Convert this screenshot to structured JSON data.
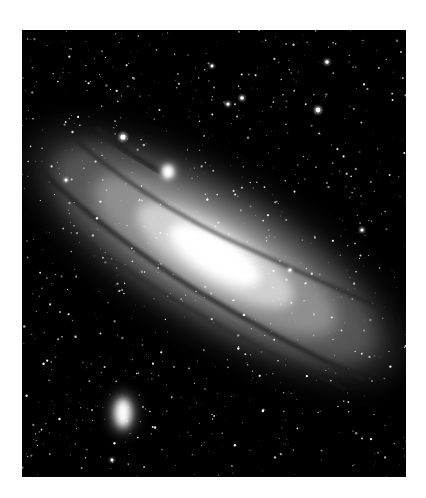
{
  "image": {
    "subject": "Andromeda Galaxy (spiral galaxy) with companion galaxies on a star field",
    "alt": "Black-and-white astronomical photograph of a large spiral galaxy seen at a steep angle, with two small companion galaxies and many foreground stars",
    "frame": {
      "x": 22,
      "y": 30,
      "width": 384,
      "height": 447
    },
    "colors": {
      "page_background": "#ffffff",
      "sky": "#000000",
      "core": "#ffffff",
      "disk_inner": "#d9d9d9",
      "disk_outer": "#8a8a8a",
      "halo": "#4a4a4a",
      "dust_lane": "#1a1a1a",
      "star": "#ffffff"
    },
    "galaxy": {
      "center": [
        193,
        225
      ],
      "rotation_deg": 31,
      "layers": [
        {
          "rx": 215,
          "ry": 78,
          "color": "#3a3a3a",
          "opacity": 0.55,
          "blur": 14
        },
        {
          "rx": 185,
          "ry": 62,
          "color": "#7a7a7a",
          "opacity": 0.6,
          "blur": 10
        },
        {
          "rx": 140,
          "ry": 44,
          "color": "#a8a8a8",
          "opacity": 0.7,
          "blur": 8
        },
        {
          "rx": 90,
          "ry": 30,
          "color": "#dcdcdc",
          "opacity": 0.85,
          "blur": 6
        },
        {
          "rx": 52,
          "ry": 20,
          "color": "#ffffff",
          "opacity": 1,
          "blur": 5
        },
        {
          "rx": 28,
          "ry": 12,
          "color": "#ffffff",
          "opacity": 1,
          "blur": 3
        }
      ],
      "dust_lanes": [
        {
          "d": "M -190 18 Q -100 38 0 40 Q 100 40 190 30",
          "width": 5,
          "opacity": 0.7
        },
        {
          "d": "M -175 -26 Q -90 -12 0 -20 Q 90 -30 170 -40",
          "width": 4,
          "opacity": 0.55
        },
        {
          "d": "M -150 50 Q -60 62 40 58 Q 120 54 180 48",
          "width": 3,
          "opacity": 0.5
        },
        {
          "d": "M -165 -48 Q -120 -40 -80 -44",
          "width": 6,
          "opacity": 0.7
        }
      ]
    },
    "companions": [
      {
        "name": "M32",
        "cx": 146,
        "cy": 142,
        "rx": 6,
        "ry": 7,
        "blur": 2
      },
      {
        "name": "M110",
        "cx": 101,
        "cy": 383,
        "rx": 8,
        "ry": 14,
        "blur": 3.5
      }
    ],
    "bright_stars": [
      {
        "x": 101,
        "y": 107,
        "r": 2.6
      },
      {
        "x": 220,
        "y": 68,
        "r": 1.8
      },
      {
        "x": 296,
        "y": 80,
        "r": 2.4
      },
      {
        "x": 305,
        "y": 32,
        "r": 1.8
      },
      {
        "x": 206,
        "y": 74,
        "r": 1.6
      },
      {
        "x": 44,
        "y": 150,
        "r": 1.5
      },
      {
        "x": 190,
        "y": 36,
        "r": 1.4
      },
      {
        "x": 340,
        "y": 200,
        "r": 1.6
      },
      {
        "x": 268,
        "y": 240,
        "r": 1.5
      },
      {
        "x": 90,
        "y": 430,
        "r": 1.4
      }
    ],
    "starfield": {
      "count": 900,
      "seed": 7,
      "min_radius": 0.35,
      "max_radius": 1.25,
      "min_opacity": 0.35,
      "max_opacity": 1
    }
  }
}
